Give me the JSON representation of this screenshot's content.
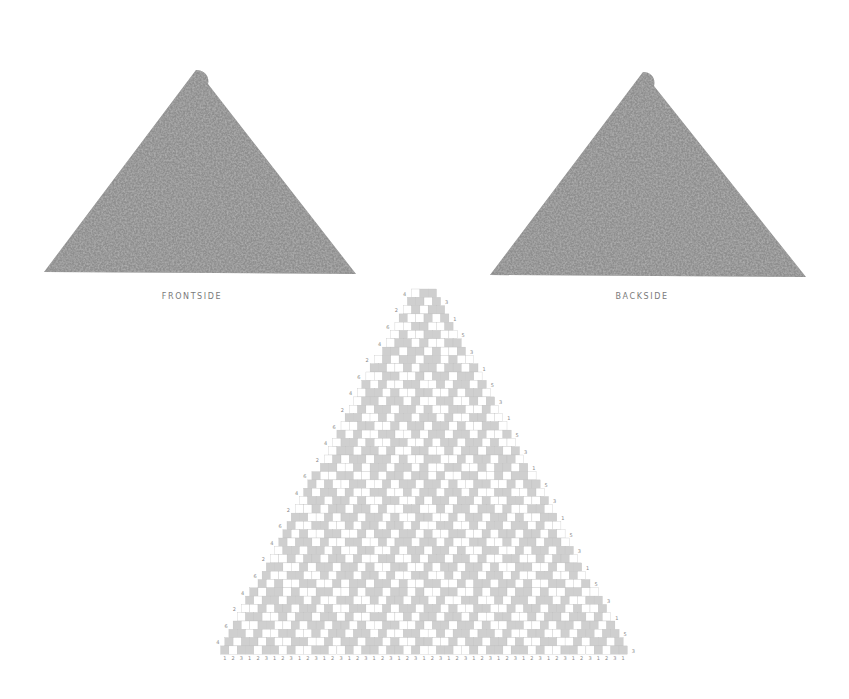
{
  "figure": {
    "left_photo": {
      "caption": "FRONTSIDE",
      "color": "#8c8c8c"
    },
    "right_photo": {
      "caption": "BACKSIDE",
      "color": "#8c8c8c"
    }
  },
  "chart_data": {
    "type": "table",
    "title": "",
    "rows": 44,
    "top_row_stitches": 3,
    "bottom_row_stitches": 49,
    "shaded_color": "#cfcfcf",
    "empty_color": "#ffffff",
    "grid_color": "#bdbdbd",
    "left_row_labels_cycle": [
      "4",
      "2",
      "6"
    ],
    "right_row_labels_cycle": [
      "3",
      "1",
      "5"
    ],
    "bottom_labels_cycle": [
      "1",
      "3",
      "2"
    ]
  }
}
